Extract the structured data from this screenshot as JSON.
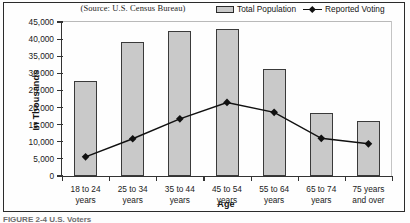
{
  "figure": {
    "source_note": "(Source: U.S. Census Bureau)",
    "caption": "FIGURE 2-4  U.S. Voters",
    "colors": {
      "bar_fill": "#c9c9c9",
      "bar_border": "#3a3a3a",
      "line": "#111111",
      "axis": "#333333",
      "background": "#fefefe"
    }
  },
  "legend": {
    "position": "top-right",
    "entries": [
      {
        "label": "Total Population",
        "marker": "gray-rectangle-swatch"
      },
      {
        "label": "Reported Voting",
        "marker": "line-with-diamond-marker"
      }
    ]
  },
  "chart_data": {
    "type": "bar",
    "title": "",
    "subtitle": "(Source: U.S. Census Bureau)",
    "xlabel": "Age",
    "ylabel": "In Thousands",
    "ylim": [
      0,
      45000
    ],
    "ytick_step": 5000,
    "ytick_labels": [
      "0",
      "5,000",
      "10,000",
      "15,000",
      "20,000",
      "25,000",
      "30,000",
      "35,000",
      "40,000",
      "45,000"
    ],
    "ytick_values": [
      0,
      5000,
      10000,
      15000,
      20000,
      25000,
      30000,
      35000,
      40000,
      45000
    ],
    "grid": false,
    "legend_position": "top-right",
    "categories": [
      "18 to 24 years",
      "25 to 34 years",
      "35 to 44 years",
      "45 to 54 years",
      "55 to 64 years",
      "65 to 74 years",
      "75 years and over"
    ],
    "category_lines": [
      [
        "18 to 24",
        "years"
      ],
      [
        "25 to 34",
        "years"
      ],
      [
        "35 to 44",
        "years"
      ],
      [
        "45 to 54",
        "years"
      ],
      [
        "55 to 64",
        "years"
      ],
      [
        "65 to 74",
        "years"
      ],
      [
        "75 years",
        "and over"
      ]
    ],
    "series": [
      {
        "name": "Total Population",
        "type": "bar",
        "values": [
          27700,
          39100,
          42300,
          42900,
          31300,
          18500,
          16200
        ]
      },
      {
        "name": "Reported Voting",
        "type": "line",
        "values": [
          5600,
          10900,
          16700,
          21500,
          18600,
          11000,
          9400
        ]
      }
    ]
  }
}
